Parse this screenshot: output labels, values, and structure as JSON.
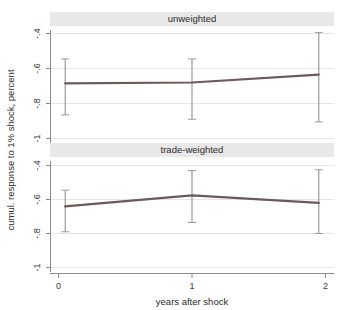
{
  "chart_data": {
    "type": "line",
    "title": "",
    "xlabel": "years after shock",
    "ylabel": "cumul. response to 1% shock, percent",
    "x": [
      0,
      1,
      2
    ],
    "xticklabels": [
      "0",
      "1",
      "2"
    ],
    "xlim": [
      -0.12,
      2.12
    ],
    "ylim": [
      -1.06,
      -0.33
    ],
    "yticks": [
      -0.4,
      -0.6,
      -0.8,
      -1
    ],
    "yticklabels": [
      "-.4",
      "-.6",
      "-.8",
      "-1"
    ],
    "grid": true,
    "legend": "none",
    "panels": [
      {
        "title": "unweighted",
        "series": [
          {
            "name": "cumulative response",
            "values": [
              -0.685,
              -0.68,
              -0.635
            ],
            "ci_lower": [
              -0.865,
              -0.89,
              -0.905
            ],
            "ci_upper": [
              -0.545,
              -0.545,
              -0.395
            ],
            "color": "#6b5a5a"
          }
        ]
      },
      {
        "title": "trade-weighted",
        "series": [
          {
            "name": "cumulative response",
            "values": [
              -0.64,
              -0.575,
              -0.62
            ],
            "ci_lower": [
              -0.79,
              -0.735,
              -0.8
            ],
            "ci_upper": [
              -0.545,
              -0.43,
              -0.425
            ],
            "color": "#6b5a5a"
          }
        ]
      }
    ],
    "colors": {
      "line": "#6b5a5a",
      "error_bar": "#9a9a9a",
      "grid": "#e6e6e6",
      "axis": "#8c8c8c",
      "panel_title_bg": "#e8e8e8",
      "background": "#ffffff"
    }
  }
}
